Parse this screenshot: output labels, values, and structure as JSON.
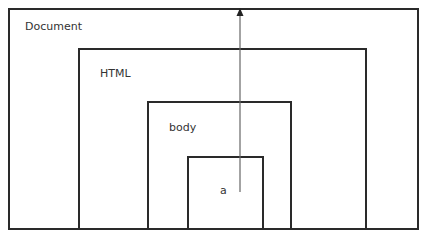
{
  "diagram": {
    "type": "nested-containment",
    "boxes": [
      {
        "label": "Document",
        "x": 8,
        "y": 8,
        "w": 411,
        "h": 222
      },
      {
        "label": "HTML",
        "x": 78,
        "y": 48,
        "w": 289,
        "h": 182
      },
      {
        "label": "body",
        "x": 147,
        "y": 101,
        "w": 145,
        "h": 129
      },
      {
        "label": "a",
        "x": 187,
        "y": 156,
        "w": 77,
        "h": 74
      }
    ],
    "arrow": {
      "from": "a",
      "to": "Document",
      "direction": "up",
      "x": 240,
      "y_start": 192,
      "y_end": 9,
      "color": "#777777"
    }
  }
}
